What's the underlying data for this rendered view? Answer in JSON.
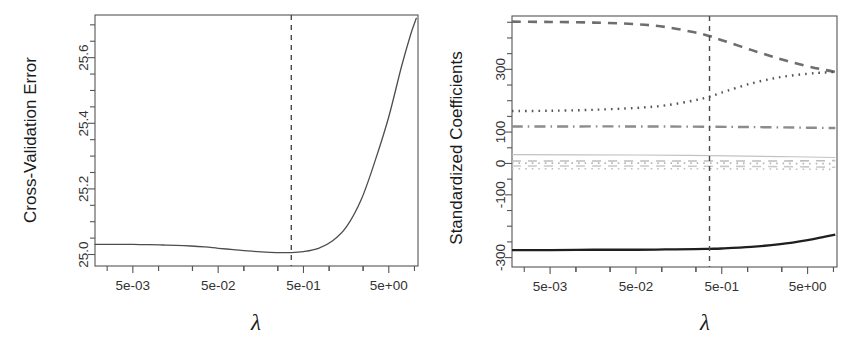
{
  "figure": {
    "background": "#ffffff",
    "width": 865,
    "height": 345,
    "panels": 2
  },
  "chart_data": [
    {
      "id": "cv-error-plot",
      "type": "line",
      "title": "",
      "xlabel": "λ",
      "ylabel": "Cross-Validation Error",
      "xscale": "log",
      "grid": false,
      "legend": null,
      "xlim": [
        0.0018,
        11.0
      ],
      "ylim": [
        24.965,
        25.73
      ],
      "xticks_labeled": [
        "5e-03",
        "5e-02",
        "5e-01",
        "5e+00"
      ],
      "xtick_values": [
        0.005,
        0.05,
        0.5,
        5
      ],
      "yticks_labeled": [
        "25.0",
        "25.2",
        "25.4",
        "25.6"
      ],
      "ytick_values": [
        25.0,
        25.2,
        25.4,
        25.6
      ],
      "minor_ticks": true,
      "annotations": [
        {
          "name": "best-lambda-vline",
          "style": "dashed-vertical",
          "x": 0.36,
          "label": ""
        }
      ],
      "series": [
        {
          "name": "Cross-Validation Error",
          "style": "solid",
          "color": "#4d4d4d",
          "x": [
            0.0018,
            0.0025,
            0.0035,
            0.005,
            0.0075,
            0.011,
            0.016,
            0.024,
            0.035,
            0.05,
            0.075,
            0.11,
            0.16,
            0.24,
            0.36,
            0.5,
            0.75,
            1.1,
            1.6,
            2.4,
            3.5,
            5.0,
            7.0,
            9.0,
            10.5
          ],
          "y": [
            25.031,
            25.031,
            25.031,
            25.031,
            25.03,
            25.029,
            25.028,
            25.026,
            25.023,
            25.019,
            25.015,
            25.011,
            25.008,
            25.006,
            25.006,
            25.009,
            25.019,
            25.042,
            25.085,
            25.17,
            25.29,
            25.42,
            25.57,
            25.67,
            25.72
          ]
        }
      ]
    },
    {
      "id": "coefficient-path-plot",
      "type": "line",
      "title": "",
      "xlabel": "λ",
      "ylabel": "Standardized Coefficients",
      "xscale": "log",
      "grid": false,
      "legend": null,
      "xlim": [
        0.0018,
        11.0
      ],
      "ylim": [
        -330,
        470
      ],
      "xticks_labeled": [
        "5e-03",
        "5e-02",
        "5e-01",
        "5e+00"
      ],
      "xtick_values": [
        0.005,
        0.05,
        0.5,
        5
      ],
      "yticks_labeled": [
        "-300",
        "-100",
        "0",
        "100",
        "300"
      ],
      "ytick_values": [
        -300,
        -100,
        0,
        100,
        300
      ],
      "minor_ticks": true,
      "annotations": [
        {
          "name": "best-lambda-vline",
          "style": "dashed-vertical",
          "x": 0.36,
          "label": ""
        }
      ],
      "series": [
        {
          "name": "coef-dashed-top",
          "style": "dashed",
          "color": "#6e6e6e",
          "width": 2.6,
          "x": [
            0.0018,
            0.005,
            0.016,
            0.05,
            0.11,
            0.24,
            0.36,
            0.5,
            1.1,
            2.4,
            5.0,
            8.0,
            10.5
          ],
          "y": [
            452,
            451,
            449,
            444,
            435,
            418,
            406,
            393,
            362,
            333,
            310,
            298,
            292
          ]
        },
        {
          "name": "coef-dotted-rising",
          "style": "dotted",
          "color": "#555555",
          "width": 2.4,
          "x": [
            0.0018,
            0.005,
            0.016,
            0.05,
            0.11,
            0.24,
            0.36,
            0.5,
            1.1,
            2.4,
            5.0,
            8.0,
            10.5
          ],
          "y": [
            167,
            168,
            171,
            177,
            185,
            201,
            213,
            226,
            255,
            275,
            286,
            290,
            292
          ]
        },
        {
          "name": "coef-dashdot-flat",
          "style": "dashdot",
          "color": "#8c8c8c",
          "width": 2.4,
          "x": [
            0.0018,
            0.005,
            0.05,
            0.36,
            1.1,
            5.0,
            10.5
          ],
          "y": [
            118,
            118,
            118,
            117,
            116,
            114,
            113
          ]
        },
        {
          "name": "coef-near-zero-a",
          "style": "solid",
          "color": "#c2c2c2",
          "width": 1.2,
          "x": [
            0.0018,
            0.05,
            0.36,
            2.4,
            10.5
          ],
          "y": [
            28,
            27,
            25,
            22,
            19
          ]
        },
        {
          "name": "coef-near-zero-b",
          "style": "dashed",
          "color": "#bdbdbd",
          "width": 1.6,
          "x": [
            0.0018,
            0.05,
            0.36,
            2.4,
            10.5
          ],
          "y": [
            8,
            8,
            8,
            8,
            9
          ]
        },
        {
          "name": "coef-near-zero-c",
          "style": "dotted",
          "color": "#b5b5b5",
          "width": 1.8,
          "x": [
            0.0018,
            0.05,
            0.36,
            2.4,
            10.5
          ],
          "y": [
            1,
            1,
            1,
            0,
            -1
          ]
        },
        {
          "name": "coef-near-zero-d",
          "style": "dashed",
          "color": "#c9c9c9",
          "width": 1.6,
          "x": [
            0.0018,
            0.05,
            0.36,
            2.4,
            10.5
          ],
          "y": [
            -8,
            -8,
            -9,
            -10,
            -12
          ]
        },
        {
          "name": "coef-near-zero-e",
          "style": "dotted",
          "color": "#bfbfbf",
          "width": 1.6,
          "x": [
            0.0018,
            0.05,
            0.36,
            2.4,
            10.5
          ],
          "y": [
            -17,
            -17,
            -17,
            -18,
            -19
          ]
        },
        {
          "name": "coef-solid-bottom",
          "style": "solid",
          "color": "#1f1f1f",
          "width": 2.3,
          "x": [
            0.0018,
            0.005,
            0.016,
            0.05,
            0.11,
            0.24,
            0.36,
            0.5,
            1.1,
            2.4,
            5.0,
            8.0,
            10.5
          ],
          "y": [
            -276,
            -276,
            -275,
            -275,
            -274,
            -273,
            -272,
            -271,
            -266,
            -257,
            -244,
            -233,
            -227
          ]
        }
      ]
    }
  ]
}
